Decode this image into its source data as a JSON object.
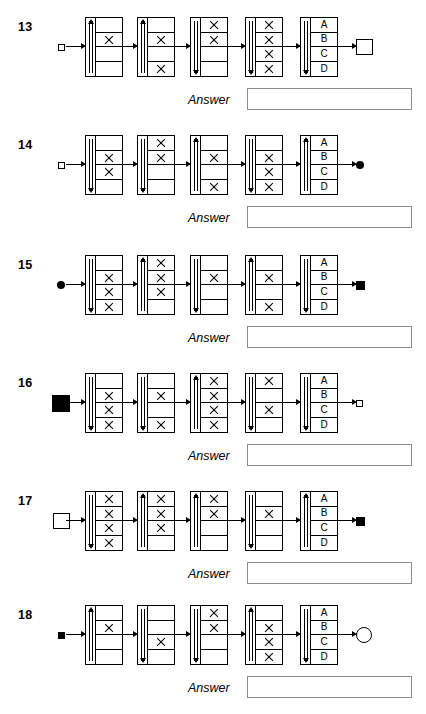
{
  "page": {
    "answer_label": "Answer",
    "letters": [
      "A",
      "B",
      "C",
      "D"
    ]
  },
  "puzzles": [
    {
      "number": "13",
      "input_symbol": "square-small-open",
      "output_symbol": "square-large-open",
      "answer_value": "",
      "gates": [
        {
          "arrow": "up",
          "marks": [
            false,
            true,
            false,
            false
          ],
          "labels": null
        },
        {
          "arrow": "up",
          "marks": [
            false,
            true,
            false,
            true
          ],
          "labels": null
        },
        {
          "arrow": "down",
          "marks": [
            true,
            true,
            false,
            false
          ],
          "labels": null
        },
        {
          "arrow": "down",
          "marks": [
            true,
            true,
            true,
            true
          ],
          "labels": null
        },
        {
          "arrow": "down",
          "marks": [
            false,
            false,
            false,
            false
          ],
          "labels": [
            "A",
            "B",
            "C",
            "D"
          ]
        }
      ]
    },
    {
      "number": "14",
      "input_symbol": "square-small-open",
      "output_symbol": "circle-small-filled",
      "answer_value": "",
      "gates": [
        {
          "arrow": "down",
          "marks": [
            false,
            true,
            true,
            false
          ],
          "labels": null
        },
        {
          "arrow": "down",
          "marks": [
            true,
            true,
            false,
            false
          ],
          "labels": null
        },
        {
          "arrow": "up",
          "marks": [
            false,
            true,
            false,
            true
          ],
          "labels": null
        },
        {
          "arrow": "down",
          "marks": [
            false,
            true,
            true,
            true
          ],
          "labels": null
        },
        {
          "arrow": "up",
          "marks": [
            false,
            false,
            false,
            false
          ],
          "labels": [
            "A",
            "B",
            "C",
            "D"
          ]
        }
      ]
    },
    {
      "number": "15",
      "input_symbol": "circle-small-filled",
      "output_symbol": "square-medium-filled",
      "answer_value": "",
      "gates": [
        {
          "arrow": "down",
          "marks": [
            false,
            true,
            true,
            true
          ],
          "labels": null
        },
        {
          "arrow": "up",
          "marks": [
            true,
            true,
            true,
            false
          ],
          "labels": null
        },
        {
          "arrow": "down",
          "marks": [
            false,
            true,
            false,
            false
          ],
          "labels": null
        },
        {
          "arrow": "up",
          "marks": [
            false,
            true,
            false,
            true
          ],
          "labels": null
        },
        {
          "arrow": "down",
          "marks": [
            false,
            false,
            false,
            false
          ],
          "labels": [
            "A",
            "B",
            "C",
            "D"
          ]
        }
      ]
    },
    {
      "number": "16",
      "input_symbol": "square-large-filled",
      "output_symbol": "square-small-open",
      "answer_value": "",
      "gates": [
        {
          "arrow": "down",
          "marks": [
            false,
            true,
            true,
            true
          ],
          "labels": null
        },
        {
          "arrow": "down",
          "marks": [
            false,
            true,
            false,
            true
          ],
          "labels": null
        },
        {
          "arrow": "up",
          "marks": [
            true,
            true,
            true,
            true
          ],
          "labels": null
        },
        {
          "arrow": "down",
          "marks": [
            true,
            false,
            true,
            false
          ],
          "labels": null
        },
        {
          "arrow": "down",
          "marks": [
            false,
            false,
            false,
            false
          ],
          "labels": [
            "A",
            "B",
            "C",
            "D"
          ]
        }
      ]
    },
    {
      "number": "17",
      "input_symbol": "square-large-open",
      "output_symbol": "square-medium-filled",
      "answer_value": "",
      "gates": [
        {
          "arrow": "down",
          "marks": [
            true,
            true,
            true,
            true
          ],
          "labels": null
        },
        {
          "arrow": "up",
          "marks": [
            true,
            true,
            true,
            false
          ],
          "labels": null
        },
        {
          "arrow": "up",
          "marks": [
            true,
            true,
            false,
            false
          ],
          "labels": null
        },
        {
          "arrow": "down",
          "marks": [
            false,
            true,
            false,
            false
          ],
          "labels": null
        },
        {
          "arrow": "up",
          "marks": [
            false,
            false,
            false,
            false
          ],
          "labels": [
            "A",
            "B",
            "C",
            "D"
          ]
        }
      ]
    },
    {
      "number": "18",
      "input_symbol": "square-small-filled",
      "output_symbol": "circle-large-open",
      "answer_value": "",
      "gates": [
        {
          "arrow": "up",
          "marks": [
            false,
            true,
            false,
            false
          ],
          "labels": null
        },
        {
          "arrow": "down",
          "marks": [
            false,
            false,
            true,
            false
          ],
          "labels": null
        },
        {
          "arrow": "down",
          "marks": [
            true,
            true,
            false,
            false
          ],
          "labels": null
        },
        {
          "arrow": "up",
          "marks": [
            false,
            true,
            true,
            true
          ],
          "labels": null
        },
        {
          "arrow": "down",
          "marks": [
            false,
            false,
            false,
            false
          ],
          "labels": [
            "A",
            "B",
            "C",
            "D"
          ]
        }
      ]
    }
  ]
}
